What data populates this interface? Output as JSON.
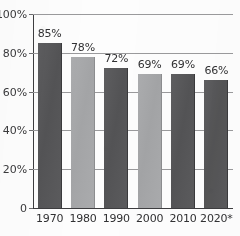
{
  "chart_data": {
    "type": "bar",
    "title": "",
    "xlabel": "",
    "ylabel": "",
    "categories": [
      "1970",
      "1980",
      "1990",
      "2000",
      "2010",
      "2020*"
    ],
    "values": [
      85,
      78,
      72,
      69,
      69,
      66
    ],
    "value_labels": [
      "85%",
      "78%",
      "72%",
      "69%",
      "69%",
      "66%"
    ],
    "ylim": [
      0,
      100
    ],
    "ytick_values": [
      0,
      20,
      40,
      60,
      80,
      100
    ],
    "ytick_labels": [
      "0",
      "20%",
      "40%",
      "60%",
      "80%",
      "100%"
    ],
    "grid": true,
    "legend": "none",
    "bar_shades": [
      "dark",
      "light",
      "dark",
      "light",
      "dark",
      "dark"
    ],
    "footnote_marker": "*"
  },
  "colors": {
    "bar_dark": "#58585a",
    "bar_light": "#a8a9ab",
    "gridline": "#9a9a9c",
    "axis": "#3d3d3f",
    "text": "#313133",
    "background": "#fdfdfd"
  }
}
